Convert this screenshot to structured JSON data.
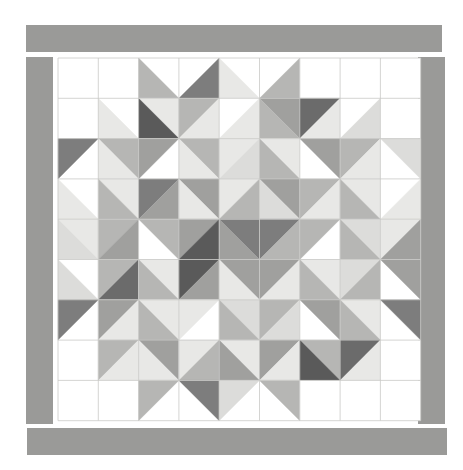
{
  "artwork": {
    "title": "Eight-Pointed Star Quilt Block",
    "type": "half-square-triangle-quilt",
    "canvas_width": 463,
    "canvas_height": 470,
    "background_color": "#ffffff"
  },
  "palette": {
    "white": "#ffffff",
    "light": "#e8e8e6",
    "light2": "#dcdcda",
    "mid": "#b6b6b4",
    "mid2": "#a0a09e",
    "dark": "#7d7d7d",
    "darker": "#6b6b6b",
    "darkest": "#5a5a5a",
    "border": "#9a9a98",
    "grid_line": "#c9c9c7",
    "outline": "#bdbdbb"
  },
  "border": {
    "name": "sashing-border",
    "color": "#9a9a98",
    "top": {
      "x": 26,
      "y": 25,
      "w": 416,
      "h": 27
    },
    "bottom": {
      "x": 27,
      "y": 428,
      "w": 420,
      "h": 27
    },
    "left": {
      "x": 26,
      "y": 57,
      "w": 27,
      "h": 367
    },
    "right": {
      "x": 418,
      "y": 57,
      "w": 27,
      "h": 367
    }
  },
  "grid": {
    "name": "quilt-grid",
    "origin_x": 58,
    "origin_y": 58,
    "cols": 9,
    "rows": 9,
    "cell": 40.3,
    "line_color": "#c9c9c7",
    "line_width": 0.8
  },
  "legend": {
    "unit_types": [
      {
        "code": "W",
        "label": "plain white square"
      },
      {
        "code": "TL",
        "label": "triangle top-left"
      },
      {
        "code": "TR",
        "label": "triangle top-right"
      },
      {
        "code": "BL",
        "label": "triangle bottom-left"
      },
      {
        "code": "BR",
        "label": "triangle bottom-right"
      },
      {
        "code": "TLBR",
        "label": "two triangles split top-left / bottom-right"
      },
      {
        "code": "TRBL",
        "label": "two triangles split top-right / bottom-left"
      }
    ]
  },
  "chart_data": {
    "type": "heatmap",
    "xlabel": "",
    "ylabel": "",
    "rows": 9,
    "cols": 9,
    "cells": [
      [
        {
          "t": "W"
        },
        {
          "t": "W"
        },
        {
          "t": "BL",
          "a": "mid"
        },
        {
          "t": "BR",
          "a": "dark"
        },
        {
          "t": "BL",
          "a": "light"
        },
        {
          "t": "BR",
          "a": "mid"
        },
        {
          "t": "W"
        },
        {
          "t": "W"
        },
        {
          "t": "W"
        }
      ],
      [
        {
          "t": "W"
        },
        {
          "t": "BL",
          "a": "light"
        },
        {
          "t": "TRBL",
          "a": "light",
          "b": "darkest"
        },
        {
          "t": "TLBR",
          "a": "mid",
          "b": "light"
        },
        {
          "t": "BR",
          "a": "light"
        },
        {
          "t": "TRBL",
          "a": "mid2",
          "b": "mid"
        },
        {
          "t": "TLBR",
          "a": "darker",
          "b": "light"
        },
        {
          "t": "BR",
          "a": "light2"
        },
        {
          "t": "W"
        }
      ],
      [
        {
          "t": "TL",
          "a": "dark"
        },
        {
          "t": "TRBL",
          "a": "mid",
          "b": "light"
        },
        {
          "t": "TL",
          "a": "mid2"
        },
        {
          "t": "TRBL",
          "a": "mid",
          "b": "light"
        },
        {
          "t": "TLBR",
          "a": "light",
          "b": "light2"
        },
        {
          "t": "TRBL",
          "a": "light",
          "b": "mid"
        },
        {
          "t": "TR",
          "a": "mid2"
        },
        {
          "t": "TLBR",
          "a": "mid",
          "b": "light"
        },
        {
          "t": "TR",
          "a": "light2"
        }
      ],
      [
        {
          "t": "BL",
          "a": "light"
        },
        {
          "t": "TRBL",
          "a": "light",
          "b": "mid"
        },
        {
          "t": "TLBR",
          "a": "dark",
          "b": "mid2"
        },
        {
          "t": "TRBL",
          "a": "mid2",
          "b": "light"
        },
        {
          "t": "TLBR",
          "a": "light",
          "b": "mid"
        },
        {
          "t": "TRBL",
          "a": "mid2",
          "b": "light2"
        },
        {
          "t": "TLBR",
          "a": "mid",
          "b": "light"
        },
        {
          "t": "TRBL",
          "a": "light",
          "b": "mid"
        },
        {
          "t": "BR",
          "a": "light"
        }
      ],
      [
        {
          "t": "TRBL",
          "a": "light",
          "b": "light2"
        },
        {
          "t": "TLBR",
          "a": "mid",
          "b": "mid2"
        },
        {
          "t": "TR",
          "a": "mid"
        },
        {
          "t": "TLBR",
          "a": "mid2",
          "b": "darkest"
        },
        {
          "t": "TRBL",
          "a": "dark",
          "b": "mid2"
        },
        {
          "t": "TLBR",
          "a": "dark",
          "b": "mid"
        },
        {
          "t": "TL",
          "a": "mid"
        },
        {
          "t": "TRBL",
          "a": "light2",
          "b": "mid"
        },
        {
          "t": "TLBR",
          "a": "light",
          "b": "mid2"
        }
      ],
      [
        {
          "t": "BL",
          "a": "light2"
        },
        {
          "t": "TLBR",
          "a": "mid",
          "b": "darker"
        },
        {
          "t": "TRBL",
          "a": "light",
          "b": "mid"
        },
        {
          "t": "TLBR",
          "a": "darkest",
          "b": "mid2"
        },
        {
          "t": "TRBL",
          "a": "mid2",
          "b": "light"
        },
        {
          "t": "TLBR",
          "a": "mid2",
          "b": "light"
        },
        {
          "t": "TRBL",
          "a": "light",
          "b": "mid"
        },
        {
          "t": "TLBR",
          "a": "light2",
          "b": "mid"
        },
        {
          "t": "TR",
          "a": "mid2"
        }
      ],
      [
        {
          "t": "TL",
          "a": "dark"
        },
        {
          "t": "TLBR",
          "a": "mid2",
          "b": "light"
        },
        {
          "t": "TRBL",
          "a": "light",
          "b": "mid"
        },
        {
          "t": "TL",
          "a": "light"
        },
        {
          "t": "TRBL",
          "a": "light2",
          "b": "mid"
        },
        {
          "t": "TLBR",
          "a": "mid",
          "b": "light2"
        },
        {
          "t": "TR",
          "a": "mid2"
        },
        {
          "t": "TRBL",
          "a": "light",
          "b": "mid"
        },
        {
          "t": "TR",
          "a": "dark"
        }
      ],
      [
        {
          "t": "W"
        },
        {
          "t": "TLBR",
          "a": "mid",
          "b": "light"
        },
        {
          "t": "TRBL",
          "a": "mid2",
          "b": "light"
        },
        {
          "t": "TLBR",
          "a": "light",
          "b": "mid"
        },
        {
          "t": "TRBL",
          "a": "light",
          "b": "mid2"
        },
        {
          "t": "TLBR",
          "a": "mid2",
          "b": "light"
        },
        {
          "t": "TRBL",
          "a": "mid",
          "b": "darkest"
        },
        {
          "t": "TLBR",
          "a": "darker",
          "b": "light"
        },
        {
          "t": "W"
        }
      ],
      [
        {
          "t": "W"
        },
        {
          "t": "W"
        },
        {
          "t": "TL",
          "a": "mid"
        },
        {
          "t": "TR",
          "a": "dark"
        },
        {
          "t": "TL",
          "a": "light2"
        },
        {
          "t": "TR",
          "a": "mid"
        },
        {
          "t": "W"
        },
        {
          "t": "W"
        },
        {
          "t": "W"
        }
      ]
    ]
  }
}
